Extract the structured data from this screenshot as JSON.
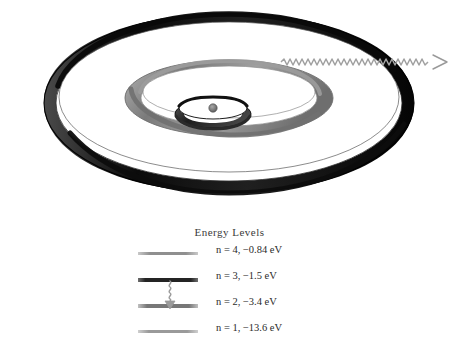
{
  "figure": {
    "title_energy_levels": "Energy Levels",
    "background_color": "#ffffff"
  },
  "atom_diagram": {
    "name": "bohr-model-orbits",
    "nucleus_label": "nucleus",
    "orbits": [
      {
        "shell": "n=1",
        "name": "inner-orbit",
        "rx": 38,
        "ry": 14,
        "band": 11,
        "color": "#3c3c3c"
      },
      {
        "shell": "n=2",
        "name": "middle-orbit",
        "rx": 104,
        "ry": 38,
        "band": 17,
        "color": "#8c8c8c"
      },
      {
        "shell": "n=3",
        "name": "outer-orbit",
        "rx": 185,
        "ry": 90,
        "band": 12,
        "color": "#121212"
      }
    ],
    "photon": {
      "name": "emitted-photon-wave",
      "label": "emitted photon",
      "color": "#9a9a9a",
      "start_x": 280,
      "end_x": 447,
      "y": 62
    }
  },
  "energy_levels": {
    "title": "Energy Levels",
    "levels": [
      {
        "n": 4,
        "label": "n = 4,   −0.84  eV",
        "energy_ev": -0.84,
        "line_color": "#9d9d9d",
        "line_thickness": 3,
        "highlighted": false
      },
      {
        "n": 3,
        "label": "n = 3,   −1.5  eV",
        "energy_ev": -1.5,
        "line_color": "#3a3a3a",
        "line_thickness": 4,
        "highlighted": true
      },
      {
        "n": 2,
        "label": "n = 2,   −3.4  eV",
        "energy_ev": -3.4,
        "line_color": "#8a8a8a",
        "line_thickness": 4,
        "highlighted": false
      },
      {
        "n": 1,
        "label": "n = 1, −13.6  eV",
        "energy_ev": -13.6,
        "line_color": "#a5a5a5",
        "line_thickness": 3,
        "highlighted": false
      }
    ],
    "transition": {
      "name": "transition-n3-to-n2",
      "from": 3,
      "to": 2,
      "color": "#9b9b9b"
    }
  }
}
